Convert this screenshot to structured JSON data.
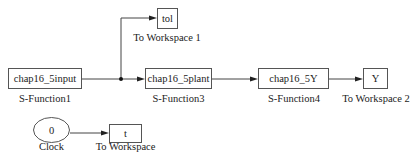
{
  "diagram": {
    "type": "simulink-block-diagram",
    "blocks": [
      {
        "id": "input",
        "text": "chap16_5input",
        "label": "S-Function1"
      },
      {
        "id": "tol",
        "text": "tol",
        "label": "To Workspace 1"
      },
      {
        "id": "plant",
        "text": "chap16_5plant",
        "label": "S-Function3"
      },
      {
        "id": "y_fn",
        "text": "chap16_5Y",
        "label": "S-Function4"
      },
      {
        "id": "y_ws",
        "text": "Y",
        "label": "To Workspace 2"
      },
      {
        "id": "clock",
        "text": "0",
        "label": "Clock"
      },
      {
        "id": "t_ws",
        "text": "t",
        "label": "To Workspace"
      }
    ],
    "connections": [
      {
        "from": "chap16_5input",
        "to": "tol",
        "via": "branch-junction"
      },
      {
        "from": "chap16_5input",
        "to": "chap16_5plant",
        "via": "branch-junction"
      },
      {
        "from": "chap16_5plant",
        "to": "chap16_5Y"
      },
      {
        "from": "chap16_5Y",
        "to": "Y"
      },
      {
        "from": "Clock",
        "to": "t"
      }
    ]
  }
}
